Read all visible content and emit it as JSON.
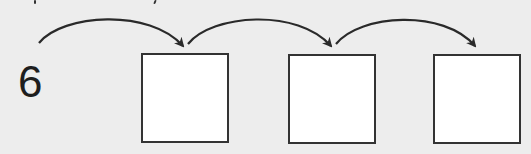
{
  "diagram": {
    "type": "number-sequence",
    "start_value": "6",
    "boxes": [
      {
        "value": "",
        "x": 141,
        "y": 53
      },
      {
        "value": "",
        "x": 288,
        "y": 54
      },
      {
        "value": "",
        "x": 433,
        "y": 54
      }
    ],
    "arrows": [
      {
        "from": "start",
        "to": "box-1"
      },
      {
        "from": "box-1",
        "to": "box-2"
      },
      {
        "from": "box-2",
        "to": "box-3"
      }
    ],
    "colors": {
      "background": "#ededed",
      "stroke": "#333333",
      "box_fill": "#ffffff",
      "text": "#1e1e1e"
    }
  }
}
